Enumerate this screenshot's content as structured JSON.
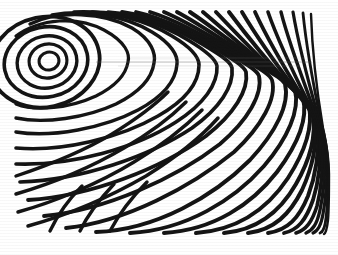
{
  "figure": {
    "caption": "",
    "background_color": "#ffffff",
    "stroke_color": "#141414",
    "artifact_color": "#5a5a5a",
    "canvas": {
      "width": 338,
      "height": 255
    },
    "content_bounds": {
      "left": 16,
      "top": 12,
      "right": 314,
      "bottom": 230
    }
  },
  "chart_data": {
    "type": "line",
    "xlabel": "",
    "ylabel": "",
    "grid": false,
    "legend": "none",
    "xlim": [
      0,
      338
    ],
    "ylim": [
      0,
      255
    ],
    "features": {
      "vortex_center": {
        "x": 49,
        "y": 61
      },
      "closed_loop_count": 5,
      "top_edge_crossings": 25,
      "bottom_edge_crossings": 19,
      "left_edge_crossings": 9,
      "right_edge_crossings": 14,
      "scan_artifact_y": 62,
      "stroke_width_range": [
        2.0,
        5.0
      ]
    },
    "closed_loops": [
      {
        "cx": 49,
        "cy": 61,
        "rx": 10,
        "ry": 9,
        "stroke": 3.0,
        "rot": -12
      },
      {
        "cx": 48,
        "cy": 61,
        "rx": 19,
        "ry": 17,
        "stroke": 3.2,
        "rot": -12
      },
      {
        "cx": 47,
        "cy": 62,
        "rx": 30,
        "ry": 26,
        "stroke": 3.4,
        "rot": -12
      },
      {
        "cx": 46,
        "cy": 62,
        "rx": 42,
        "ry": 35,
        "stroke": 3.6,
        "rot": -12
      },
      {
        "cx": 45,
        "cy": 62,
        "rx": 55,
        "ry": 45,
        "stroke": 3.8,
        "rot": -12
      }
    ],
    "series": [
      {
        "name": "arc-01",
        "stroke": 3.2,
        "path": "M 16 36 C 40 18, 78 16, 104 30 C 126 42, 130 54, 128 62 C 126 74, 116 86, 96 96 C 70 108, 36 112, 16 104"
      },
      {
        "name": "arc-02",
        "stroke": 3.4,
        "path": "M 30 24 C 58 10, 104 12, 132 28 C 152 40, 156 54, 154 63 C 152 78, 140 92, 116 104 C 86 118, 44 124, 16 118"
      },
      {
        "name": "arc-03",
        "stroke": 3.5,
        "path": "M 52 15 C 86 9, 126 16, 152 32 C 172 44, 178 56, 177 64 C 176 80, 164 96, 138 110 C 104 128, 52 138, 16 132"
      },
      {
        "name": "arc-04",
        "stroke": 3.6,
        "path": "M 74 12 C 108 10, 146 20, 172 36 C 192 48, 199 58, 199 65 C 199 82, 186 100, 158 116 C 120 138, 62 152, 16 148"
      },
      {
        "name": "arc-05",
        "stroke": 3.6,
        "path": "M 92 12 C 126 12, 162 24, 188 40 C 208 52, 216 60, 217 66 C 218 84, 204 104, 176 122 C 136 148, 72 166, 16 164"
      },
      {
        "name": "arc-06",
        "stroke": 3.7,
        "path": "M 108 12 C 140 14, 176 28, 202 44 C 222 56, 231 62, 232 68 C 234 86, 220 108, 192 128 C 150 156, 82 180, 20 182"
      },
      {
        "name": "arc-07",
        "stroke": 3.8,
        "path": "M 122 12 C 152 16, 188 32, 214 48 C 234 60, 244 66, 246 72 C 249 90, 234 114, 206 136 C 162 168, 92 196, 28 200"
      },
      {
        "name": "arc-08",
        "stroke": 3.8,
        "path": "M 136 12 C 164 18, 200 36, 226 52 C 246 64, 257 70, 259 76 C 263 94, 248 120, 220 144 C 176 178, 106 210, 44 216"
      },
      {
        "name": "arc-09",
        "stroke": 3.8,
        "path": "M 150 12 C 176 20, 212 40, 238 56 C 258 68, 270 74, 272 80 C 277 98, 262 126, 234 152 C 192 186, 126 222, 66 228"
      },
      {
        "name": "arc-10",
        "stroke": 3.9,
        "path": "M 164 12 C 188 22, 224 44, 250 60 C 270 72, 282 78, 285 84 C 290 104, 276 132, 250 160 C 214 196, 156 230, 96 232"
      },
      {
        "name": "arc-11",
        "stroke": 3.9,
        "path": "M 177 12 C 200 24, 234 48, 260 64 C 280 76, 292 84, 295 90 C 300 110, 288 138, 264 166 C 234 200, 186 230, 130 233"
      },
      {
        "name": "arc-12",
        "stroke": 4.0,
        "path": "M 190 12 C 211 26, 244 52, 268 68 C 288 82, 300 90, 303 98 C 308 118, 298 144, 277 172 C 252 204, 214 230, 164 233"
      },
      {
        "name": "arc-13",
        "stroke": 4.0,
        "path": "M 203 12 C 222 28, 253 56, 276 74 C 294 88, 306 98, 309 106 C 313 126, 306 150, 288 178 C 268 208, 238 230, 196 233"
      },
      {
        "name": "arc-14",
        "stroke": 4.0,
        "path": "M 216 12 C 233 30, 262 60, 283 80 C 300 96, 311 106, 313 114 C 316 134, 311 158, 296 184 C 280 212, 258 230, 224 233"
      },
      {
        "name": "arc-15",
        "stroke": 4.0,
        "path": "M 229 12 C 244 32, 270 64, 290 86 C 305 102, 314 114, 315 122 C 317 142, 314 164, 302 190 C 290 214, 274 230, 248 233"
      },
      {
        "name": "arc-16",
        "stroke": 3.9,
        "path": "M 242 12 C 255 34, 279 68, 297 92 C 310 108, 317 120, 318 130 C 319 150, 317 172, 308 196 C 299 218, 288 230, 268 233"
      },
      {
        "name": "arc-17",
        "stroke": 3.8,
        "path": "M 255 12 C 266 36, 287 72, 303 98 C 314 114, 320 128, 320 138 C 321 158, 320 178, 313 200 C 306 220, 298 230, 284 233"
      },
      {
        "name": "arc-18",
        "stroke": 3.6,
        "path": "M 268 12 C 277 38, 295 76, 309 104 C 318 120, 323 134, 323 146 C 323 166, 322 186, 317 206 C 312 222, 306 230, 296 233"
      },
      {
        "name": "arc-19",
        "stroke": 3.4,
        "path": "M 281 12 C 288 40, 303 80, 314 110 C 321 128, 325 142, 325 154 C 325 174, 324 192, 320 210 C 317 224, 313 230, 306 233"
      },
      {
        "name": "arc-20",
        "stroke": 3.2,
        "path": "M 293 12 C 298 42, 309 84, 318 116 C 324 134, 327 150, 327 162 C 327 180, 326 198, 323 214 C 321 226, 318 231, 313 233"
      },
      {
        "name": "arc-21",
        "stroke": 2.8,
        "path": "M 303 13 C 306 44, 314 88, 321 122 C 326 140, 328 156, 328 168 C 328 186, 328 202, 326 218 C 325 228, 323 232, 320 233"
      },
      {
        "name": "arc-22",
        "stroke": 2.4,
        "path": "M 311 14 C 312 46, 317 92, 323 128 C 327 146, 329 162, 329 174 C 329 192, 329 208, 328 220 C 327 229, 326 233, 324 234"
      },
      {
        "name": "lower-fan-01",
        "stroke": 3.4,
        "path": "M 16 176 C 46 166, 82 152, 112 134 C 138 118, 156 104, 168 92"
      },
      {
        "name": "lower-fan-02",
        "stroke": 3.5,
        "path": "M 16 194 C 50 184, 90 168, 124 148 C 152 132, 172 116, 186 102"
      },
      {
        "name": "lower-fan-03",
        "stroke": 3.5,
        "path": "M 18 212 C 54 202, 98 184, 134 162 C 164 144, 186 126, 202 110"
      },
      {
        "name": "lower-fan-04",
        "stroke": 3.5,
        "path": "M 28 226 C 64 216, 108 198, 146 176 C 178 156, 202 136, 218 118"
      },
      {
        "name": "bottom-hook-01",
        "stroke": 3.4,
        "path": "M 50 231 C 58 214, 68 200, 82 186"
      },
      {
        "name": "bottom-hook-02",
        "stroke": 3.4,
        "path": "M 80 231 C 88 214, 99 200, 114 184"
      },
      {
        "name": "bottom-hook-03",
        "stroke": 3.4,
        "path": "M 110 231 C 119 214, 131 198, 147 182"
      }
    ],
    "scan_artifacts": [
      {
        "name": "artifact-main",
        "y": 62,
        "x0": 96,
        "x1": 312
      },
      {
        "name": "artifact-upper",
        "y": 58,
        "x0": 130,
        "x1": 305
      },
      {
        "name": "artifact-lower",
        "y": 66,
        "x0": 118,
        "x1": 300
      }
    ]
  }
}
